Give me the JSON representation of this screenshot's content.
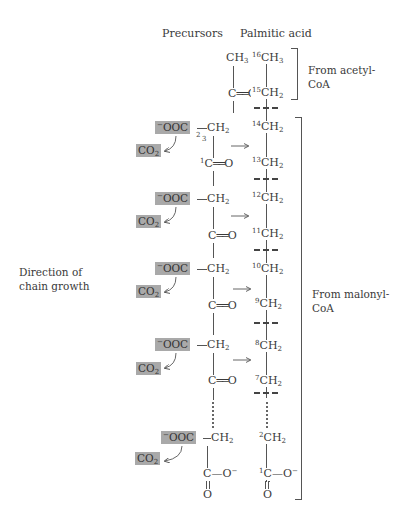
{
  "headers": {
    "precursors": "Precursors",
    "palmitic_acid": "Palmitic acid"
  },
  "labels": {
    "direction": "Direction of chain growth",
    "from_acetyl": "From acetyl-CoA",
    "from_malonyl": "From malonyl-CoA"
  },
  "precursors": {
    "acetyl": {
      "top": "CH3",
      "bottom": "C=O"
    },
    "malonyl_units": [
      {
        "carboxyl": "-OOC",
        "methylene": "CH2",
        "carbonyl": "C=O",
        "released": "CO2",
        "numbered": true,
        "num_carboxyl": "3",
        "num_methylene": "2",
        "num_carbonyl": "1"
      },
      {
        "carboxyl": "-OOC",
        "methylene": "CH2",
        "carbonyl": "C=O",
        "released": "CO2"
      },
      {
        "carboxyl": "-OOC",
        "methylene": "CH2",
        "carbonyl": "C=O",
        "released": "CO2"
      },
      {
        "carboxyl": "-OOC",
        "methylene": "CH2",
        "carbonyl": "C=O",
        "released": "CO2"
      },
      {
        "carboxyl": "-OOC",
        "methylene": "CH2",
        "carbonyl": "C-O-",
        "released": "CO2",
        "terminal": true
      }
    ]
  },
  "palmitic_chain": [
    {
      "num": "16",
      "group": "CH3"
    },
    {
      "num": "15",
      "group": "CH2"
    },
    {
      "num": "14",
      "group": "CH2"
    },
    {
      "num": "13",
      "group": "CH2"
    },
    {
      "num": "12",
      "group": "CH2"
    },
    {
      "num": "11",
      "group": "CH2"
    },
    {
      "num": "10",
      "group": "CH2"
    },
    {
      "num": "9",
      "group": "CH2"
    },
    {
      "num": "8",
      "group": "CH2"
    },
    {
      "num": "7",
      "group": "CH2"
    },
    {
      "num": "2",
      "group": "CH2"
    },
    {
      "num": "1",
      "group": "C-O-"
    }
  ],
  "colors": {
    "highlight_box": "#a9a9a9",
    "line": "#555555",
    "text": "#3a3a3a"
  }
}
